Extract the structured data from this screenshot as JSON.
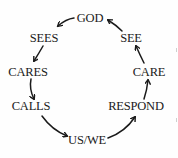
{
  "diagram": {
    "type": "cycle",
    "nodes": [
      {
        "id": "god",
        "label": "GOD",
        "x": 90,
        "y": 18
      },
      {
        "id": "sees",
        "label": "SEES",
        "x": 44,
        "y": 38
      },
      {
        "id": "cares",
        "label": "CARES",
        "x": 28,
        "y": 72
      },
      {
        "id": "calls",
        "label": "CALLS",
        "x": 31,
        "y": 106
      },
      {
        "id": "uswe",
        "label": "US/WE",
        "x": 87,
        "y": 140
      },
      {
        "id": "respond",
        "label": "RESPOND",
        "x": 136,
        "y": 106
      },
      {
        "id": "care",
        "label": "CARE",
        "x": 149,
        "y": 72
      },
      {
        "id": "see",
        "label": "SEE",
        "x": 131,
        "y": 38
      }
    ],
    "edges": [
      {
        "from": "god",
        "to": "sees"
      },
      {
        "from": "sees",
        "to": "cares"
      },
      {
        "from": "cares",
        "to": "calls"
      },
      {
        "from": "calls",
        "to": "uswe"
      },
      {
        "from": "uswe",
        "to": "respond"
      },
      {
        "from": "respond",
        "to": "care"
      },
      {
        "from": "care",
        "to": "see"
      },
      {
        "from": "see",
        "to": "god"
      }
    ],
    "colors": {
      "text": "#1a1a1a",
      "arrow": "#1a1a1a",
      "background": "#fefefe"
    }
  }
}
